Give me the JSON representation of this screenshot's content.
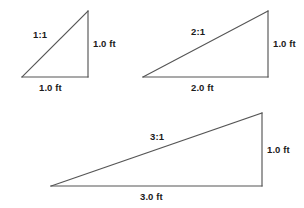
{
  "figure": {
    "background_color": "#ffffff",
    "line_color": "#555555",
    "text_color": "#1b1b1b"
  },
  "triangles": [
    {
      "id": "triangle-1-1",
      "ratio_label": "1:1",
      "base_label": "1.0 ft",
      "height_label": "1.0 ft",
      "base_feet": 1.0,
      "height_feet": 1.0
    },
    {
      "id": "triangle-2-1",
      "ratio_label": "2:1",
      "base_label": "2.0 ft",
      "height_label": "1.0 ft",
      "base_feet": 2.0,
      "height_feet": 1.0
    },
    {
      "id": "triangle-3-1",
      "ratio_label": "3:1",
      "base_label": "3.0 ft",
      "height_label": "1.0 ft",
      "base_feet": 3.0,
      "height_feet": 1.0
    }
  ]
}
